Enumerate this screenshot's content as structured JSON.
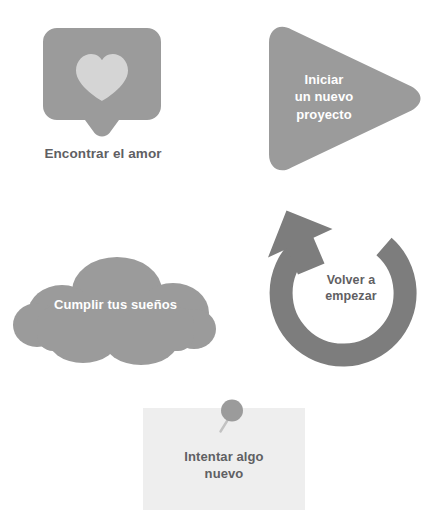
{
  "page": {
    "background_color": "#ffffff",
    "width": 443,
    "height": 527,
    "language": "es"
  },
  "palette": {
    "shape_gray": "#9b9b9b",
    "shape_gray_dark": "#7d7d7d",
    "heart_light": "#d5d5d5",
    "note_paper": "#eeeeee",
    "text_dark": "#5f6063",
    "text_light": "#ffffff"
  },
  "items": [
    {
      "id": "find-love",
      "icon": "speech-bubble-heart-icon",
      "label": "Encontrar el amor",
      "label_position": "below",
      "label_color": "#5f6063",
      "shape_color": "#9b9b9b",
      "accent_color": "#d5d5d5"
    },
    {
      "id": "new-project",
      "icon": "play-triangle-icon",
      "label": "Iniciar\nun nuevo\nproyecto",
      "label_position": "inside",
      "label_color": "#ffffff",
      "shape_color": "#9b9b9b"
    },
    {
      "id": "start-over",
      "icon": "circular-arrow-icon",
      "label": "Volver a\nempezar",
      "label_position": "inside",
      "label_color": "#5f6063",
      "shape_color": "#7d7d7d"
    },
    {
      "id": "dreams",
      "icon": "cloud-icon",
      "label": "Cumplir tus sueños",
      "label_position": "inside",
      "label_color": "#ffffff",
      "shape_color": "#9b9b9b"
    },
    {
      "id": "try-new",
      "icon": "sticky-note-pin-icon",
      "label": "Intentar algo\nnuevo",
      "label_position": "inside",
      "label_color": "#5f6063",
      "shape_color": "#eeeeee",
      "accent_color": "#9b9b9b"
    }
  ]
}
